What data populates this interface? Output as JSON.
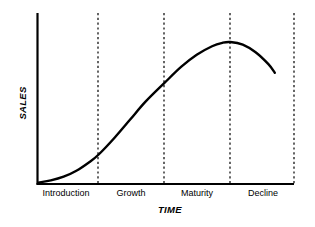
{
  "chart_data": {
    "type": "line",
    "title": "",
    "subtitle": "",
    "xlabel": "TIME",
    "ylabel": "SALES",
    "grid": false,
    "legend": null,
    "x_tick_labels": [
      "Introduction",
      "Growth",
      "Maturity",
      "Decline"
    ],
    "y_tick_labels": [],
    "xlim": [
      0,
      100
    ],
    "ylim": [
      0,
      100
    ],
    "axis_color": "#000000",
    "curve_color": "#000000",
    "divider_color": "#000000",
    "divider_style": "dashed",
    "stage_boundaries_x": [
      23.7,
      49.4,
      75.1,
      100
    ],
    "series": [
      {
        "name": "Sales",
        "description": "Product life cycle sales curve",
        "points": [
          {
            "x": 0.4,
            "y": 0.6
          },
          {
            "x": 5.0,
            "y": 1.8
          },
          {
            "x": 10.0,
            "y": 4.0
          },
          {
            "x": 15.0,
            "y": 7.5
          },
          {
            "x": 20.0,
            "y": 12.5
          },
          {
            "x": 23.7,
            "y": 17.0
          },
          {
            "x": 30.0,
            "y": 27.0
          },
          {
            "x": 36.0,
            "y": 37.5
          },
          {
            "x": 42.0,
            "y": 48.0
          },
          {
            "x": 49.4,
            "y": 59.0
          },
          {
            "x": 56.0,
            "y": 68.5
          },
          {
            "x": 62.0,
            "y": 75.5
          },
          {
            "x": 68.0,
            "y": 80.5
          },
          {
            "x": 72.0,
            "y": 82.5
          },
          {
            "x": 75.1,
            "y": 83.0
          },
          {
            "x": 80.0,
            "y": 81.5
          },
          {
            "x": 85.0,
            "y": 77.0
          },
          {
            "x": 90.0,
            "y": 70.0
          },
          {
            "x": 92.5,
            "y": 65.0
          }
        ]
      }
    ],
    "annotations": [
      {
        "label": "Introduction",
        "stage_center_x": 11.8
      },
      {
        "label": "Growth",
        "stage_center_x": 36.5
      },
      {
        "label": "Maturity",
        "stage_center_x": 62.2
      },
      {
        "label": "Decline",
        "stage_center_x": 87.5
      }
    ]
  },
  "axes": {
    "y_axis_title": "SALES",
    "x_axis_title": "TIME"
  },
  "stages": [
    {
      "label": "Introduction"
    },
    {
      "label": "Growth"
    },
    {
      "label": "Maturity"
    },
    {
      "label": "Decline"
    }
  ]
}
